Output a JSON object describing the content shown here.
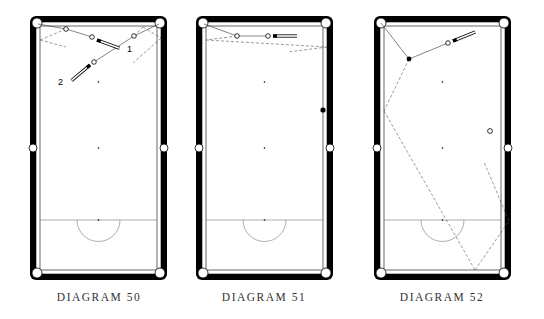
{
  "diagrams": [
    {
      "id": "50",
      "caption": "DIAGRAM 50",
      "x": 30,
      "labels": [
        {
          "text": "1",
          "x": 127,
          "y": 52
        },
        {
          "text": "2",
          "x": 60,
          "y": 84
        }
      ]
    },
    {
      "id": "51",
      "caption": "DIAGRAM 51",
      "x": 196
    },
    {
      "id": "52",
      "caption": "DIAGRAM 52",
      "x": 374
    }
  ],
  "table": {
    "width": 137,
    "height": 264,
    "top": 16,
    "rail_color": "#000000",
    "cloth_color": "#ffffff",
    "line_color": "#555555"
  }
}
